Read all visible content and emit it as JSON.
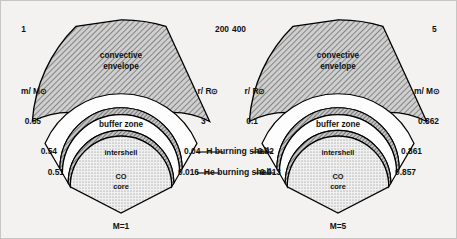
{
  "figure": {
    "type": "stellar-structure-cross-section-pair",
    "background_color": "#f3f2f0",
    "ink_color": "#000000",
    "envelope_fill": "#b3b3b3",
    "shell_fill": "#a8a8a8",
    "core_fill": "#ededed"
  },
  "shared_labels": {
    "h_burning_shell": "H burning shell",
    "he_burning_shell": "He burning shell",
    "convective_envelope_line1": "convective",
    "convective_envelope_line2": "envelope",
    "buffer_zone": "buffer zone",
    "intershell": "intershell",
    "co_core_line1": "CO",
    "co_core_line2": "core",
    "axis_mass": "m/ M",
    "axis_radius": "r/ R",
    "solar_symbol": "⊙"
  },
  "panels": [
    {
      "id": "left-panel",
      "mass_label": "M=1",
      "left_axis": "m/ M⊙",
      "left_axis_kind": "mass",
      "right_axis": "r/ R⊙",
      "right_axis_kind": "radius",
      "left_values": {
        "envelope_top": "1",
        "envelope_base": "0.55",
        "h_shell": "0.54",
        "he_shell": "0.51"
      },
      "right_values": {
        "envelope_top": "200",
        "envelope_base": "3",
        "h_shell": "0.04",
        "he_shell": "0.016"
      }
    },
    {
      "id": "right-panel",
      "mass_label": "M=5",
      "left_axis": "r/ R⊙",
      "left_axis_kind": "radius",
      "right_axis": "m/ M⊙",
      "right_axis_kind": "mass",
      "left_values": {
        "envelope_top": "400",
        "envelope_base": "0.1",
        "h_shell": "0.02",
        "he_shell": "0.013"
      },
      "right_values": {
        "envelope_top": "5",
        "envelope_base": "0.862",
        "h_shell": "0.861",
        "he_shell": "0.857"
      }
    }
  ]
}
